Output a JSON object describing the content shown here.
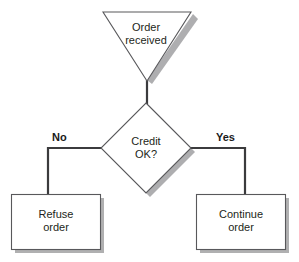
{
  "diagram": {
    "type": "flowchart",
    "colors": {
      "shape_fill": "#ffffff",
      "shape_stroke": "#58585b",
      "connector": "#3b3b3d",
      "shadow": "#9a9a9c",
      "text": "#231f20",
      "branch_label_text": "#1a1a1a",
      "background": "#ffffff"
    },
    "nodes": [
      {
        "id": "start",
        "shape": "inverted-triangle",
        "label": "Order\nreceived",
        "label_line1": "Order",
        "label_line2": "received"
      },
      {
        "id": "decision",
        "shape": "diamond",
        "label": "Credit\nOK?",
        "label_line1": "Credit",
        "label_line2": "OK?"
      },
      {
        "id": "refuse",
        "shape": "rectangle",
        "label": "Refuse\norder",
        "label_line1": "Refuse",
        "label_line2": "order"
      },
      {
        "id": "continue",
        "shape": "rectangle",
        "label": "Continue\norder",
        "label_line1": "Continue",
        "label_line2": "order"
      }
    ],
    "edges": [
      {
        "id": "start-to-decision",
        "from": "start",
        "to": "decision",
        "label": ""
      },
      {
        "id": "decision-to-refuse",
        "from": "decision",
        "to": "refuse",
        "label": "No"
      },
      {
        "id": "decision-to-continue",
        "from": "decision",
        "to": "continue",
        "label": "Yes"
      }
    ],
    "branch_labels": {
      "no": "No",
      "yes": "Yes"
    }
  }
}
